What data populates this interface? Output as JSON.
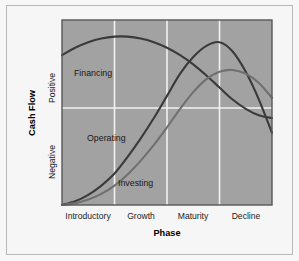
{
  "chart_data": {
    "type": "line",
    "title": "",
    "xlabel": "Phase",
    "ylabel": "Cash Flow",
    "grid": true,
    "legend_position": "inline-labels",
    "x_tick_labels": [
      "Introductory",
      "Growth",
      "Maturity",
      "Decline"
    ],
    "y_tick_labels": [
      "Positive",
      "Negative"
    ],
    "y_zero_label": "",
    "xlim": [
      0,
      4
    ],
    "ylim": [
      -1,
      1
    ],
    "categories": [
      "Introductory",
      "Growth",
      "Maturity",
      "Decline"
    ],
    "series": [
      {
        "name": "Financing",
        "color": "#3a3a3a",
        "label_x": 0.28,
        "label_y": 0.52,
        "description": "Starts positive at introduction, peaks early in growth, then declines steadily toward zero by decline.",
        "x": [
          0.0,
          0.25,
          0.5,
          0.75,
          1.0,
          1.25,
          1.5,
          1.75,
          2.0,
          2.25,
          2.5,
          2.75,
          3.0,
          3.25,
          3.5,
          3.75,
          4.0
        ],
        "y": [
          0.62,
          0.7,
          0.76,
          0.8,
          0.82,
          0.82,
          0.8,
          0.76,
          0.7,
          0.62,
          0.52,
          0.4,
          0.27,
          0.14,
          0.04,
          -0.03,
          -0.06
        ]
      },
      {
        "name": "Operating",
        "color": "#3a3a3a",
        "label_x": 0.5,
        "label_y": -0.32,
        "description": "Deeply negative at introduction, rises through growth, crosses zero in maturity, peaks, then falls sharply during decline.",
        "x": [
          0.0,
          0.25,
          0.5,
          0.75,
          1.0,
          1.25,
          1.5,
          1.75,
          2.0,
          2.25,
          2.5,
          2.75,
          3.0,
          3.25,
          3.5,
          3.75,
          4.0
        ],
        "y": [
          -1.0,
          -0.96,
          -0.89,
          -0.79,
          -0.66,
          -0.48,
          -0.28,
          -0.06,
          0.18,
          0.42,
          0.6,
          0.72,
          0.76,
          0.66,
          0.44,
          0.14,
          -0.22
        ]
      },
      {
        "name": "Investing",
        "color": "#707070",
        "label_x": 1.05,
        "label_y": -0.72,
        "description": "Most negative at introduction, rises more slowly than operating, crosses zero late in maturity, peaks lower, then eases down.",
        "x": [
          0.0,
          0.25,
          0.5,
          0.75,
          1.0,
          1.25,
          1.5,
          1.75,
          2.0,
          2.25,
          2.5,
          2.75,
          3.0,
          3.25,
          3.5,
          3.75,
          4.0
        ],
        "y": [
          -1.0,
          -0.98,
          -0.94,
          -0.88,
          -0.79,
          -0.67,
          -0.52,
          -0.35,
          -0.16,
          0.04,
          0.22,
          0.36,
          0.44,
          0.46,
          0.42,
          0.32,
          0.16
        ]
      }
    ],
    "colors": {
      "plot_background": "#a2a2a2",
      "gridline": "#f2f2f2",
      "plot_border": "#585858",
      "figure_background": "#f7f7f7",
      "frame_border": "#b9b9b9",
      "dark_series": "#3a3a3a",
      "light_series": "#707070",
      "text": "#1a1a1a"
    }
  },
  "axes": {
    "y_axis_title": "Cash Flow",
    "y_upper_region_label": "Positive",
    "y_lower_region_label": "Negative",
    "x_axis_title": "Phase",
    "x_categories": [
      {
        "label": "Introductory"
      },
      {
        "label": "Growth"
      },
      {
        "label": "Maturity"
      },
      {
        "label": "Decline"
      }
    ]
  },
  "series_labels": [
    {
      "label": "Financing"
    },
    {
      "label": "Operating"
    },
    {
      "label": "Investing"
    }
  ]
}
